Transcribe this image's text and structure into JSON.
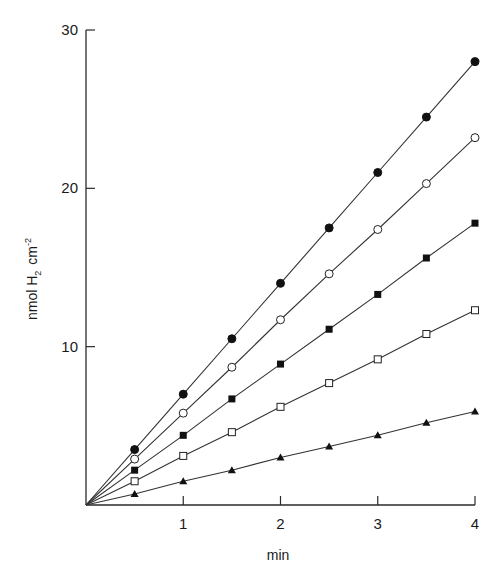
{
  "chart_data": {
    "type": "line",
    "title": "",
    "xlabel": "min",
    "ylabel": "nmol H2 cm-2",
    "ylabel_parts": {
      "main": "nmol H",
      "sub": "2",
      "unit": "cm",
      "sup": "-2"
    },
    "xlim": [
      0,
      4
    ],
    "ylim": [
      0,
      30
    ],
    "x_ticks": [
      1,
      2,
      3,
      4
    ],
    "y_ticks": [
      10,
      20,
      30
    ],
    "grid": false,
    "legend": "none",
    "x": [
      0.5,
      1.0,
      1.5,
      2.0,
      2.5,
      3.0,
      3.5,
      4.0
    ],
    "series": [
      {
        "name": "filled-circle",
        "marker": "filled-circle",
        "values": [
          3.5,
          7.0,
          10.5,
          14.0,
          17.5,
          21.0,
          24.5,
          28.0
        ]
      },
      {
        "name": "open-circle",
        "marker": "open-circle",
        "values": [
          2.9,
          5.8,
          8.7,
          11.7,
          14.6,
          17.4,
          20.3,
          23.2
        ]
      },
      {
        "name": "filled-square",
        "marker": "filled-square",
        "values": [
          2.2,
          4.4,
          6.7,
          8.9,
          11.1,
          13.3,
          15.6,
          17.8
        ]
      },
      {
        "name": "open-square",
        "marker": "open-square",
        "values": [
          1.5,
          3.1,
          4.6,
          6.2,
          7.7,
          9.2,
          10.8,
          12.3
        ]
      },
      {
        "name": "filled-triangle",
        "marker": "filled-triangle",
        "values": [
          0.7,
          1.5,
          2.2,
          3.0,
          3.7,
          4.4,
          5.2,
          5.9
        ]
      }
    ]
  }
}
